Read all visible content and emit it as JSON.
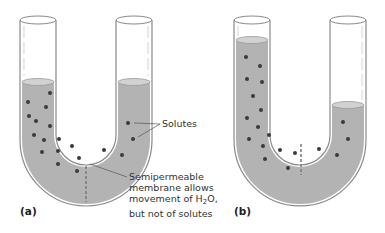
{
  "figure": {
    "panels": [
      {
        "id": "a",
        "label": "(a)"
      },
      {
        "id": "b",
        "label": "(b)"
      }
    ],
    "annotations": {
      "solutes": "Solutes",
      "membrane_line1": "Semipermeable",
      "membrane_line2": "membrane allows",
      "membrane_line3_pre": "movement of H",
      "membrane_line3_sub": "2",
      "membrane_line3_post": "O,",
      "membrane_line4": "but not of solutes"
    },
    "colors": {
      "liquid": "#b3b3b3",
      "liquid_surface": "#cfcfcf",
      "tube_outline": "#8a8a8a",
      "solute": "#3a3a3a",
      "membrane": "#7a7a7a",
      "background": "#ffffff"
    }
  }
}
